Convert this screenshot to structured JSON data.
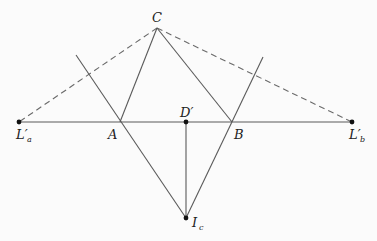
{
  "figure": {
    "type": "geometry-diagram",
    "points": {
      "C": {
        "label": "C",
        "sub": "",
        "x": 157,
        "y": 28
      },
      "A": {
        "label": "A",
        "sub": "",
        "x": 120,
        "y": 122
      },
      "B": {
        "label": "B",
        "sub": "",
        "x": 232,
        "y": 122
      },
      "Dp": {
        "label": "D′",
        "sub": "",
        "x": 186,
        "y": 122
      },
      "Lpa": {
        "label": "L′",
        "sub": "a",
        "x": 19,
        "y": 122
      },
      "Lpb": {
        "label": "L′",
        "sub": "b",
        "x": 352,
        "y": 122
      },
      "Ic": {
        "label": "I",
        "sub": "c",
        "x": 186,
        "y": 218
      }
    },
    "solid_segments": [
      [
        "Lpa",
        "Lpb"
      ],
      [
        "C",
        "A"
      ],
      [
        "C",
        "B"
      ],
      [
        "Dp",
        "Ic"
      ],
      [
        "A-ext-top",
        "Ic"
      ],
      [
        "B-ext-top",
        "Ic"
      ]
    ],
    "dashed_segments": [
      [
        "C",
        "Lpa"
      ],
      [
        "C",
        "Lpb"
      ]
    ],
    "extension_endpoints": {
      "A-ext-top": {
        "x": 76,
        "y": 55
      },
      "B-ext-top": {
        "x": 263,
        "y": 57
      }
    },
    "dotted_points": [
      "Lpa",
      "Dp",
      "Lpb",
      "Ic"
    ]
  }
}
